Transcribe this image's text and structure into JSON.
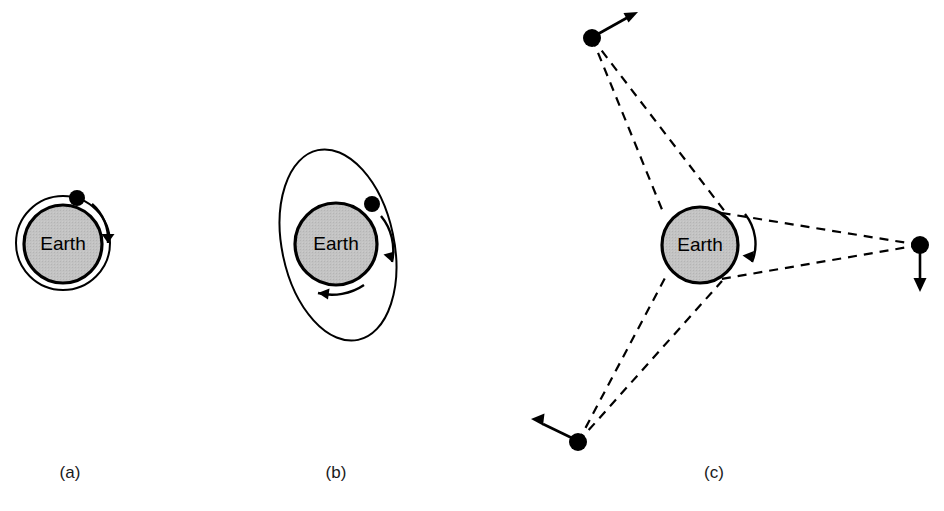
{
  "figure": {
    "background_color": "#ffffff",
    "line_color": "#000000",
    "earth_fill_color": "#c0c0c0",
    "width": 944,
    "height": 511
  },
  "panels": [
    {
      "caption": "(a)",
      "caption_x": 70,
      "caption_y": 478,
      "earth_label": "Earth",
      "earth": {
        "cx": 63,
        "cy": 244,
        "r": 39
      },
      "orbit": {
        "type": "circle",
        "cx": 63,
        "cy": 243,
        "r": 47
      },
      "satellite": {
        "cx": 77,
        "cy": 198,
        "r": 8
      },
      "direction_arrow": "clockwise"
    },
    {
      "caption": "(b)",
      "caption_x": 336,
      "caption_y": 478,
      "earth_label": "Earth",
      "earth": {
        "cx": 336,
        "cy": 244,
        "r": 41
      },
      "orbit": {
        "type": "ellipse",
        "cx": 338,
        "cy": 245,
        "rx": 56,
        "ry": 97,
        "rotation": -12
      },
      "satellite": {
        "cx": 372,
        "cy": 204,
        "r": 8
      },
      "direction_arrow": "clockwise"
    },
    {
      "caption": "(c)",
      "caption_x": 714,
      "caption_y": 478,
      "earth_label": "Earth",
      "earth": {
        "cx": 700,
        "cy": 245,
        "r": 38
      },
      "rotation_arrow": "clockwise",
      "satellites": [
        {
          "name": "satellite-top",
          "cx": 592,
          "cy": 38,
          "r": 9,
          "velocity_dx": 36,
          "velocity_dy": -22
        },
        {
          "name": "satellite-right",
          "cx": 920,
          "cy": 245,
          "r": 9,
          "velocity_dx": 0,
          "velocity_dy": 42
        },
        {
          "name": "satellite-bottom-left",
          "cx": 578,
          "cy": 442,
          "r": 9,
          "velocity_dx": -42,
          "velocity_dy": -22
        }
      ],
      "sight_lines_note": "dashed tangent lines from each satellite to Earth limb"
    }
  ]
}
